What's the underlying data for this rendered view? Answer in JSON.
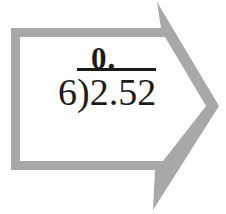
{
  "figure": {
    "division": {
      "quotient": "0.",
      "divisor": "6",
      "bracket": ")",
      "dividend": "2.52"
    },
    "colors": {
      "arrow_outline": "#a8a8a8",
      "arrow_interior": "#ffffff",
      "text": "#1b1b1b",
      "background": "#ffffff"
    }
  }
}
